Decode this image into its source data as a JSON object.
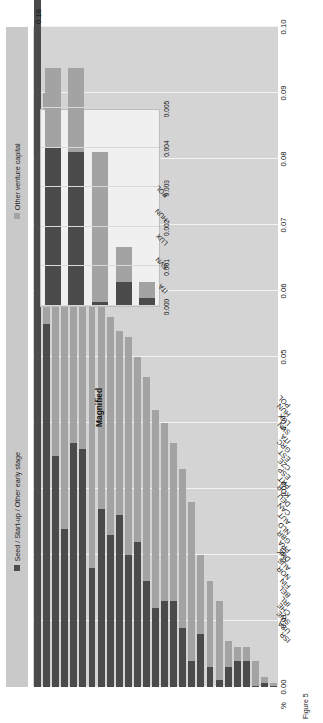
{
  "figure": {
    "caption": "Figure 5",
    "axis_title": "%",
    "overflow_label": "0.18"
  },
  "legend": {
    "items": [
      {
        "label": "Seed / Start-up / Other early stage",
        "color": "#4b4b4b",
        "icon": "legend-square-dark"
      },
      {
        "label": "Other venture capital",
        "color": "#a3a3a3",
        "icon": "legend-square-light"
      }
    ]
  },
  "inset": {
    "title": "Magnified",
    "ticks": [
      "0.000",
      "0.001",
      "0.002",
      "0.003",
      "0.004",
      "0.005"
    ],
    "categories": [
      "ITA",
      "SVN",
      "LUX",
      "HUN",
      "POL"
    ]
  },
  "chart_data": {
    "type": "bar",
    "orientation": "horizontal-rotated",
    "title": "",
    "subtitle": "",
    "xlabel": "",
    "ylabel": "%",
    "ylim": [
      0.0,
      0.1
    ],
    "grid": true,
    "legend_position": "top",
    "note": "Stacked bar: venture capital investment as percentage of GDP. ISR total 0.18 exceeds axis maximum.",
    "tick_labels": [
      "0.00",
      "0.01",
      "0.02",
      "0.03",
      "0.04",
      "0.05",
      "0.06",
      "0.07",
      "0.08",
      "0.09",
      "0.10"
    ],
    "categories": [
      "ISR",
      "USA",
      "SWE",
      "CHE",
      "IRL",
      "BEL",
      "FIN",
      "NOR",
      "AUS",
      "DNK",
      "FRA",
      "GBR",
      "NLD",
      "AUT",
      "CAN",
      "DEU",
      "KOR",
      "PRT",
      "ESP",
      "CZE",
      "EST",
      "GRC",
      "ITA",
      "SVN",
      "LUX",
      "HUN",
      "POL"
    ],
    "series": [
      {
        "name": "Seed / Start-up / Other early stage",
        "color": "#4b4b4b",
        "values": [
          0.16,
          0.055,
          0.035,
          0.024,
          0.037,
          0.036,
          0.018,
          0.027,
          0.023,
          0.026,
          0.02,
          0.022,
          0.016,
          0.012,
          0.013,
          0.013,
          0.009,
          0.004,
          0.008,
          0.003,
          0.001,
          0.003,
          0.004,
          0.0039,
          0.0001,
          0.0006,
          0.0002
        ]
      },
      {
        "name": "Other venture capital",
        "color": "#a3a3a3",
        "values": [
          0.02,
          0.035,
          0.04,
          0.043,
          0.029,
          0.028,
          0.043,
          0.032,
          0.033,
          0.028,
          0.033,
          0.028,
          0.031,
          0.03,
          0.027,
          0.024,
          0.024,
          0.024,
          0.012,
          0.013,
          0.012,
          0.004,
          0.002,
          0.0021,
          0.0038,
          0.0009,
          0.0004
        ]
      }
    ],
    "totals": [
      0.18,
      0.09,
      0.075,
      0.067,
      0.066,
      0.064,
      0.061,
      0.059,
      0.056,
      0.054,
      0.053,
      0.05,
      0.047,
      0.042,
      0.04,
      0.037,
      0.033,
      0.028,
      0.02,
      0.016,
      0.013,
      0.007,
      0.006,
      0.006,
      0.0039,
      0.0015,
      0.0006
    ]
  },
  "inset_data": {
    "type": "bar",
    "categories": [
      "ITA",
      "SVN",
      "LUX",
      "HUN",
      "POL"
    ],
    "xlim": [
      0.0,
      0.005
    ],
    "series": [
      {
        "name": "Seed / Start-up / Other early stage",
        "color": "#4b4b4b",
        "values": [
          0.004,
          0.0039,
          0.0001,
          0.0006,
          0.0002
        ]
      },
      {
        "name": "Other venture capital",
        "color": "#a3a3a3",
        "values": [
          0.002,
          0.0021,
          0.0038,
          0.0009,
          0.0004
        ]
      }
    ]
  }
}
